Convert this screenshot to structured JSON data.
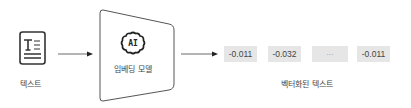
{
  "input": {
    "label": "텍스트",
    "icon": "text-document-icon"
  },
  "model": {
    "label": "임베딩 모델",
    "icon": "ai-brain-icon",
    "icon_text": "AI"
  },
  "output": {
    "label": "벡터화된 텍스트",
    "values": [
      "-0.011",
      "-0.032",
      "···",
      "-0.011"
    ]
  },
  "colors": {
    "stroke": "#333333",
    "box_fill": "#e6e6e6",
    "shape_stroke": "#555555"
  }
}
